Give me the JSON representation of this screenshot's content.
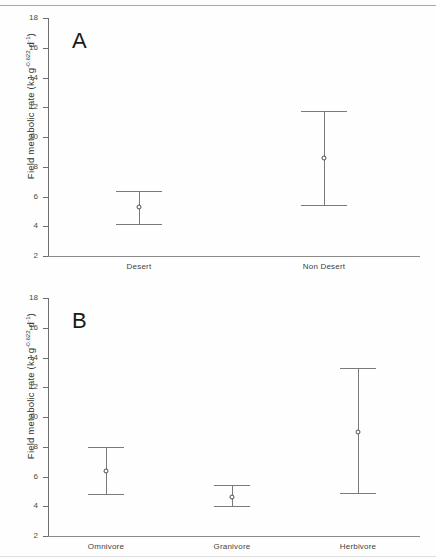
{
  "figure": {
    "type": "error-bar-figure",
    "background": "#fefefe",
    "line_color": "#7a7a7a",
    "marker_color": "#4a4a4a",
    "text_color": "#3a3a3a"
  },
  "panels": {
    "a": {
      "letter": "A",
      "ylabel_main": "Field metabolic rate (kJ g",
      "ylabel_exp1": "-0.622",
      "ylabel_mid": " d",
      "ylabel_exp2": "-1",
      "ylabel_end": ")",
      "ticks": [
        "18",
        "16",
        "14",
        "12",
        "10",
        "8",
        "6",
        "4",
        "2"
      ],
      "categories": [
        "Desert",
        "Non Desert"
      ]
    },
    "b": {
      "letter": "B",
      "ylabel_main": "Field metabolic rate (kJ g",
      "ylabel_exp1": "-0.622",
      "ylabel_mid": " d",
      "ylabel_exp2": "-1",
      "ylabel_end": ")",
      "ticks": [
        "18",
        "16",
        "14",
        "12",
        "10",
        "8",
        "6",
        "4",
        "2"
      ],
      "categories": [
        "Omnivore",
        "Granivore",
        "Herbivore"
      ]
    }
  },
  "chart_data": [
    {
      "type": "scatter",
      "panel": "A",
      "title": "A",
      "xlabel": "",
      "ylabel": "Field metabolic rate (kJ g^-0.622 d^-1)",
      "ylim": [
        2,
        18
      ],
      "yticks": [
        2,
        4,
        6,
        8,
        10,
        12,
        14,
        16,
        18
      ],
      "grid": false,
      "legend": false,
      "marker": "open-circle",
      "errorbar": "range-with-caps",
      "categories": [
        "Desert",
        "Non Desert"
      ],
      "values": [
        5.3,
        8.6
      ],
      "error_upper": [
        6.4,
        11.75
      ],
      "error_lower": [
        4.15,
        5.45
      ]
    },
    {
      "type": "scatter",
      "panel": "B",
      "title": "B",
      "xlabel": "",
      "ylabel": "Field metabolic rate (kJ g^-0.622 d^-1)",
      "ylim": [
        2,
        18
      ],
      "yticks": [
        2,
        4,
        6,
        8,
        10,
        12,
        14,
        16,
        18
      ],
      "grid": false,
      "legend": false,
      "marker": "open-circle",
      "errorbar": "range-with-caps",
      "categories": [
        "Omnivore",
        "Granivore",
        "Herbivore"
      ],
      "values": [
        6.4,
        4.65,
        9.0
      ],
      "error_upper": [
        8.0,
        5.4,
        13.3
      ],
      "error_lower": [
        4.85,
        4.0,
        4.9
      ]
    }
  ]
}
